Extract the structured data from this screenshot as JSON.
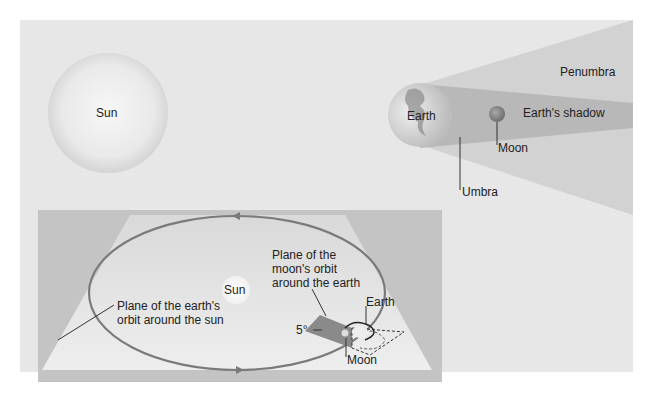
{
  "top_diagram": {
    "sun_label": "Sun",
    "earth_label": "Earth",
    "penumbra_label": "Penumbra",
    "shadow_label": "Earth's shadow",
    "moon_label": "Moon",
    "umbra_label": "Umbra"
  },
  "inset_diagram": {
    "sun_label": "Sun",
    "earth_orbit_plane_label_line1": "Plane of the earth's",
    "earth_orbit_plane_label_line2": "orbit around the sun",
    "moon_orbit_plane_label_line1": "Plane of the",
    "moon_orbit_plane_label_line2": "moon's orbit",
    "moon_orbit_plane_label_line3": "around the earth",
    "earth_label": "Earth",
    "moon_label": "Moon",
    "angle_label": "5°"
  },
  "colors": {
    "background": "#e7e7e7",
    "inset_bg": "#c4c4c4",
    "plane": "#e2e2e2",
    "orbit": "#7a7a7a",
    "penumbra": "#d2d2d2",
    "umbra": "#b8b8b8"
  }
}
